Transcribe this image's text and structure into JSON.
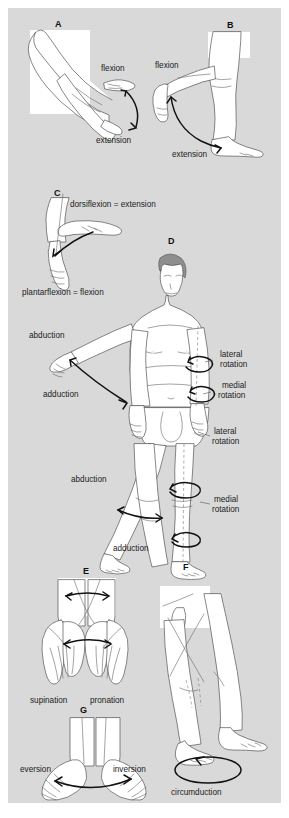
{
  "figure": {
    "background_color": "#d9d9d9",
    "panel_box_color": "#ffffff",
    "ink_color": "#1b1b1b",
    "width": 289,
    "height": 818
  },
  "panels": [
    {
      "letter": "A",
      "name": "elbow-flexion-extension",
      "labels": [
        "flexion",
        "extension"
      ]
    },
    {
      "letter": "B",
      "name": "knee-flexion-extension",
      "labels": [
        "flexion",
        "extension"
      ]
    },
    {
      "letter": "C",
      "name": "ankle-dorsiflexion-plantarflexion",
      "labels": [
        "dorsiflexion = extension",
        "plantarflexion = flexion"
      ]
    },
    {
      "letter": "D",
      "name": "whole-body-abduction-adduction-rotation",
      "labels": [
        "abduction",
        "adduction",
        "lateral rotation",
        "medial rotation",
        "lateral rotation",
        "medial rotation",
        "abduction",
        "adduction"
      ]
    },
    {
      "letter": "E",
      "name": "forearm-supination-pronation",
      "labels": [
        "supination",
        "pronation"
      ]
    },
    {
      "letter": "F",
      "name": "hip-circumduction",
      "labels": [
        "circumduction"
      ]
    },
    {
      "letter": "G",
      "name": "foot-eversion-inversion",
      "labels": [
        "eversion",
        "inversion"
      ]
    }
  ],
  "labels": {
    "a_flexion": "flexion",
    "a_extension": "extension",
    "b_flexion": "flexion",
    "b_extension": "extension",
    "c_dorsiflexion": "dorsiflexion = extension",
    "c_plantarflexion": "plantarflexion = flexion",
    "d_arm_abduction": "abduction",
    "d_arm_adduction": "adduction",
    "d_arm_lateral_1": "lateral",
    "d_arm_lateral_2": "rotation",
    "d_arm_medial_1": "medial",
    "d_arm_medial_2": "rotation",
    "d_leg_lateral_1": "lateral",
    "d_leg_lateral_2": "rotation",
    "d_leg_medial_1": "medial",
    "d_leg_medial_2": "rotation",
    "d_leg_abduction": "abduction",
    "d_leg_adduction": "adduction",
    "e_supination": "supination",
    "e_pronation": "pronation",
    "f_circumduction": "circumduction",
    "g_eversion": "eversion",
    "g_inversion": "inversion"
  },
  "panel_letters": {
    "a": "A",
    "b": "B",
    "c": "C",
    "d": "D",
    "e": "E",
    "f": "F",
    "g": "G"
  }
}
